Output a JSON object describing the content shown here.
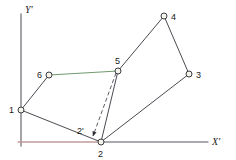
{
  "figure": {
    "title": "",
    "background": "#ffffff",
    "axes": {
      "x_axis_label": "X'",
      "y_axis_label": "Y'",
      "x_axis_color": "#b08a8a",
      "y_axis_color": "#8a8a8a",
      "origin": {
        "x": 21,
        "y": 142
      },
      "x_axis_end": {
        "x": 208,
        "y": 142
      },
      "y_axis_end": {
        "x": 21,
        "y": 14
      }
    },
    "line_color": "#4a4a52",
    "highlight_color": "#7fc77f",
    "marker_fill": "#f5f2e8",
    "marker_stroke": "#3a3a42",
    "vertices": [
      {
        "id": "1",
        "label": "1",
        "x": 21,
        "y": 110,
        "label_dx": -9,
        "label_dy": 2,
        "marker": "open"
      },
      {
        "id": "2",
        "label": "2",
        "x": 101,
        "y": 142,
        "label_dx": -3,
        "label_dy": 14,
        "marker": "open"
      },
      {
        "id": "3",
        "label": "3",
        "x": 189,
        "y": 74,
        "label_dx": 6,
        "label_dy": 4,
        "marker": "open"
      },
      {
        "id": "4",
        "label": "4",
        "x": 164,
        "y": 16,
        "label_dx": 6,
        "label_dy": 4,
        "marker": "open"
      },
      {
        "id": "5",
        "label": "5",
        "x": 118,
        "y": 71,
        "label_dx": -2,
        "label_dy": -6,
        "marker": "open"
      },
      {
        "id": "6",
        "label": "6",
        "x": 49,
        "y": 75,
        "label_dx": -11,
        "label_dy": 3,
        "marker": "open"
      }
    ],
    "derived_points": [
      {
        "id": "2p",
        "label": "2'",
        "x": 91,
        "y": 137,
        "label_dx": -13,
        "label_dy": -4,
        "marker": "filled"
      }
    ],
    "edges": [
      {
        "from": "1",
        "to": "6",
        "style": "solid",
        "color": "#4a4a52"
      },
      {
        "from": "6",
        "to": "5",
        "style": "solid",
        "color": "#6f9a6f"
      },
      {
        "from": "5",
        "to": "4",
        "style": "solid",
        "color": "#4a4a52"
      },
      {
        "from": "4",
        "to": "3",
        "style": "solid",
        "color": "#4a4a52"
      },
      {
        "from": "3",
        "to": "2",
        "style": "solid",
        "color": "#4a4a52"
      },
      {
        "from": "2",
        "to": "1",
        "style": "solid",
        "color": "#4a4a52"
      },
      {
        "from": "5",
        "to": "2",
        "style": "solid",
        "color": "#4a4a52"
      }
    ],
    "arrows": [
      {
        "id": "five-to-twoprime",
        "from": "5",
        "to": "2p",
        "style": "dashed",
        "color": "#4a4a52",
        "arrowhead": true
      }
    ]
  }
}
